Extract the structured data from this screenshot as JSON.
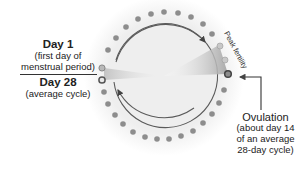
{
  "diagram": {
    "labels": {
      "day1": {
        "title": "Day 1",
        "line1": "(first day of",
        "line2": "menstrual period)"
      },
      "day28": {
        "title": "Day 28",
        "line1": "(average cycle)"
      },
      "peak_fertility": "Peak fertility",
      "ovulation": {
        "title": "Ovulation",
        "line1": "(about day 14",
        "line2": "of an average",
        "line3": "28-day cycle)"
      }
    },
    "cycle": {
      "total_days": 28,
      "ovulation_day": 14,
      "peak_fertility_days": [
        12,
        13,
        14
      ]
    },
    "colors": {
      "disk": "#f1f1f1",
      "dot": "#8d8d8d",
      "dot_highlight": "#b9b9b9",
      "ring_line": "#5a5a5a",
      "text": "#222222"
    }
  }
}
